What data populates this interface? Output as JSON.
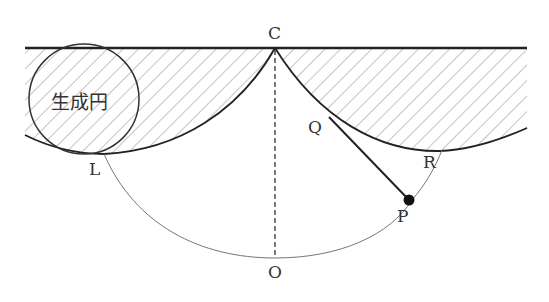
{
  "figure": {
    "labels": {
      "C": "C",
      "Q": "Q",
      "L": "L",
      "R": "R",
      "P": "P",
      "O": "O",
      "generating_circle": "生成円"
    },
    "colors": {
      "line": "#222222",
      "thin_line": "#777777",
      "hatch": "#8a8a8a",
      "text": "#333333",
      "background": "#ffffff"
    },
    "points": {
      "C": [
        275,
        48
      ],
      "Q": [
        329,
        117
      ],
      "P": [
        409,
        200
      ],
      "L": [
        104,
        154
      ],
      "R": [
        442,
        150
      ],
      "O": [
        275,
        258
      ]
    },
    "ceiling": {
      "x1": 25,
      "x2": 527,
      "y": 48
    },
    "generating_circle": {
      "cx": 84,
      "cy": 99,
      "r": 55
    }
  }
}
